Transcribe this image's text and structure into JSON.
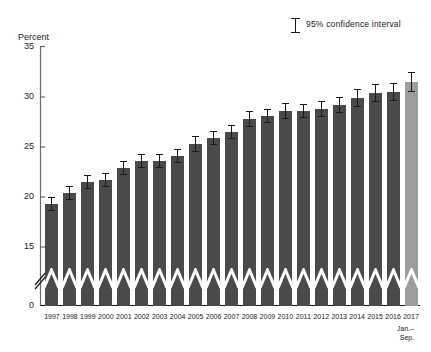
{
  "chart_data": {
    "type": "bar",
    "title": "",
    "ylabel": "Percent",
    "xlabel": "",
    "ylim": [
      0,
      35
    ],
    "yticks": [
      0,
      15,
      20,
      25,
      30,
      35
    ],
    "ytick_labels": [
      "0",
      "15",
      "20",
      "25",
      "30",
      "35"
    ],
    "axis_break": true,
    "axis_break_between": [
      0,
      15
    ],
    "grid": false,
    "legend_position": "top-right",
    "legend": [
      {
        "label": "95% confidence interval",
        "marker": "error-bar-icon"
      }
    ],
    "categories": [
      "1997",
      "1998",
      "1999",
      "2000",
      "2001",
      "2002",
      "2003",
      "2004",
      "2005",
      "2006",
      "2007",
      "2008",
      "2009",
      "2010",
      "2011",
      "2012",
      "2013",
      "2014",
      "2015",
      "2016",
      "2017"
    ],
    "category_sublabels": [
      "",
      "",
      "",
      "",
      "",
      "",
      "",
      "",
      "",
      "",
      "",
      "",
      "",
      "",
      "",
      "",
      "",
      "",
      "",
      "",
      "Jan.–\nSep."
    ],
    "values": [
      19.3,
      20.4,
      21.5,
      21.7,
      22.9,
      23.6,
      23.6,
      24.1,
      25.3,
      25.9,
      26.5,
      27.8,
      28.1,
      28.6,
      28.6,
      28.8,
      29.2,
      29.9,
      30.4,
      30.5,
      31.5
    ],
    "ci_low": [
      18.6,
      19.7,
      20.8,
      21.0,
      22.2,
      22.9,
      22.9,
      23.4,
      24.5,
      25.2,
      25.8,
      27.0,
      27.4,
      27.8,
      27.9,
      28.0,
      28.4,
      29.0,
      29.5,
      29.6,
      30.5
    ],
    "ci_high": [
      20.0,
      21.1,
      22.2,
      22.4,
      23.6,
      24.3,
      24.3,
      24.8,
      26.1,
      26.6,
      27.2,
      28.6,
      28.8,
      29.4,
      29.3,
      29.6,
      30.0,
      30.8,
      31.3,
      31.4,
      32.5
    ],
    "bar_colors": [
      "#4a4a4a",
      "#4a4a4a",
      "#4a4a4a",
      "#4a4a4a",
      "#4a4a4a",
      "#4a4a4a",
      "#4a4a4a",
      "#4a4a4a",
      "#4a4a4a",
      "#4a4a4a",
      "#4a4a4a",
      "#4a4a4a",
      "#4a4a4a",
      "#4a4a4a",
      "#4a4a4a",
      "#4a4a4a",
      "#4a4a4a",
      "#4a4a4a",
      "#4a4a4a",
      "#4a4a4a",
      "#9d9d9d"
    ],
    "highlight_index": 20,
    "accent_color": "#4a4a4a",
    "highlight_color": "#9d9d9d",
    "axis_color": "#6b6b6b",
    "text_color": "#1a1a1a"
  },
  "xaxis": {
    "sub_label_line1": "Jan.–",
    "sub_label_line2": "Sep."
  }
}
